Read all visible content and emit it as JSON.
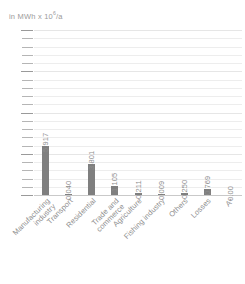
{
  "chart_data": {
    "type": "bar",
    "title": "",
    "subtitle": "",
    "ylabel": "in MWh x 10⁶/a",
    "ylabel_parts": {
      "prefix": "in MWh x 10",
      "exponent": "6",
      "suffix": "/a"
    },
    "xlabel": "",
    "ylim": [
      0,
      20
    ],
    "yticks": [
      0,
      5,
      10,
      15,
      20
    ],
    "ytick_labels": [
      "0",
      "5",
      "10",
      "15",
      "20"
    ],
    "minor_tick_step": 1,
    "grid": true,
    "legend": false,
    "bar_color": "#7f7f7f",
    "grid_color": "#ededed",
    "axis_color": "#c9c9c9",
    "text_color": "#8e8e8e",
    "categories": [
      "Manufacturing industry",
      "Transport",
      "Residential",
      "Trade and commerce",
      "Agriculture",
      "Fishing industry",
      "Others",
      "Losses",
      "A*"
    ],
    "category_lines": [
      [
        "Manufacturing",
        "industry"
      ],
      [
        "Transport"
      ],
      [
        "Residential"
      ],
      [
        "Trade and",
        "commerce"
      ],
      [
        "Agriculture"
      ],
      [
        "Fishing industry"
      ],
      [
        "Others"
      ],
      [
        "Losses"
      ],
      [
        "A*"
      ]
    ],
    "values": [
      5.917,
      0.04,
      3.801,
      1.105,
      0.211,
      0.009,
      0.25,
      0.769,
      0.0
    ],
    "value_labels": [
      "5.917",
      "0.040",
      "3.801",
      "1.105",
      "0.211",
      "0.009",
      "0.250",
      "0.769",
      "0.00"
    ]
  }
}
